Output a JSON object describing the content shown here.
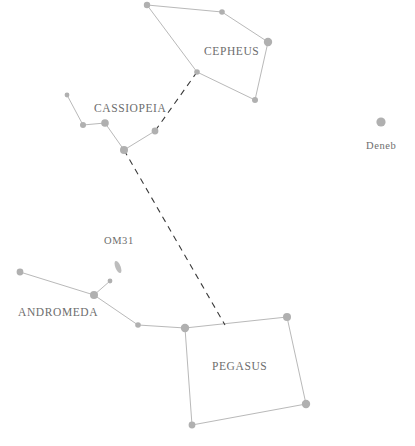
{
  "chart_data": {
    "type": "scatter",
    "title": "",
    "subtitle": "",
    "xlabel": "",
    "ylabel": "",
    "xlim": [
      0,
      415
    ],
    "ylim": [
      0,
      446
    ],
    "grid": false,
    "legend": "none",
    "background_color": "#ffffff",
    "star_color": "#b0b0b0",
    "line_color": "#b9b9b9",
    "pointer_color": "#3a3a3a",
    "label_color": "#6d6d6d",
    "constellations": [
      {
        "name": "CEPHEUS",
        "label_x": 204,
        "label_y": 45,
        "stars": [
          {
            "name": "cepheus-star-1",
            "x": 147,
            "y": 5,
            "r": 3.2
          },
          {
            "name": "cepheus-star-2",
            "x": 222,
            "y": 12,
            "r": 2.8
          },
          {
            "name": "cepheus-star-3",
            "x": 268,
            "y": 42,
            "r": 4.2
          },
          {
            "name": "cepheus-star-4",
            "x": 255,
            "y": 100,
            "r": 3.0
          },
          {
            "name": "cepheus-star-5",
            "x": 197,
            "y": 72,
            "r": 2.8
          }
        ],
        "segments": [
          [
            0,
            1
          ],
          [
            1,
            2
          ],
          [
            2,
            3
          ],
          [
            3,
            4
          ],
          [
            4,
            0
          ]
        ]
      },
      {
        "name": "CASSIOPEIA",
        "label_x": 94,
        "label_y": 102,
        "stars": [
          {
            "name": "cassiopeia-star-1",
            "x": 67,
            "y": 95,
            "r": 2.4
          },
          {
            "name": "cassiopeia-star-2",
            "x": 83,
            "y": 125,
            "r": 3.0
          },
          {
            "name": "cassiopeia-star-3",
            "x": 105,
            "y": 123,
            "r": 3.8
          },
          {
            "name": "cassiopeia-star-4",
            "x": 124,
            "y": 150,
            "r": 4.0
          },
          {
            "name": "cassiopeia-star-5",
            "x": 155,
            "y": 131,
            "r": 3.4
          }
        ],
        "segments": [
          [
            0,
            1
          ],
          [
            1,
            2
          ],
          [
            2,
            3
          ],
          [
            3,
            4
          ]
        ]
      },
      {
        "name": "ANDROMEDA",
        "label_x": 18,
        "label_y": 306,
        "stars": [
          {
            "name": "andromeda-star-1",
            "x": 20,
            "y": 272,
            "r": 3.4
          },
          {
            "name": "andromeda-star-2",
            "x": 94,
            "y": 295,
            "r": 4.0
          },
          {
            "name": "andromeda-star-3",
            "x": 138,
            "y": 325,
            "r": 2.8
          },
          {
            "name": "andromeda-star-4",
            "x": 110,
            "y": 281,
            "r": 2.4
          }
        ],
        "segments": [
          [
            0,
            1
          ],
          [
            1,
            2
          ],
          [
            1,
            3
          ]
        ]
      },
      {
        "name": "PEGASUS",
        "label_x": 212,
        "label_y": 360,
        "stars": [
          {
            "name": "pegasus-star-1",
            "x": 185,
            "y": 328,
            "r": 4.2
          },
          {
            "name": "pegasus-star-2",
            "x": 287,
            "y": 317,
            "r": 4.0
          },
          {
            "name": "pegasus-star-3",
            "x": 306,
            "y": 404,
            "r": 4.2
          },
          {
            "name": "pegasus-star-4",
            "x": 192,
            "y": 425,
            "r": 3.4
          }
        ],
        "segments": [
          [
            0,
            1
          ],
          [
            1,
            2
          ],
          [
            2,
            3
          ],
          [
            3,
            0
          ]
        ]
      }
    ],
    "bridge_segments": [
      {
        "name": "andromeda-to-pegasus",
        "x1": 138,
        "y1": 325,
        "x2": 185,
        "y2": 328
      }
    ],
    "named_stars": [
      {
        "name": "Deneb",
        "label": "Deneb",
        "x": 381,
        "y": 122,
        "r": 4.6,
        "label_x": 366,
        "label_y": 140
      }
    ],
    "deep_sky_objects": [
      {
        "name": "M31",
        "label": "OM31",
        "x": 118,
        "y": 267,
        "rx": 2.6,
        "ry": 6.5,
        "rotation": -22,
        "label_x": 104,
        "label_y": 235
      }
    ],
    "pointer_lines": [
      {
        "name": "cassiopeia-to-cepheus-pointer",
        "points": "197,72 155,131"
      },
      {
        "name": "cassiopeia-to-pegasus-pointer",
        "points": "124,150 225,325"
      }
    ]
  }
}
